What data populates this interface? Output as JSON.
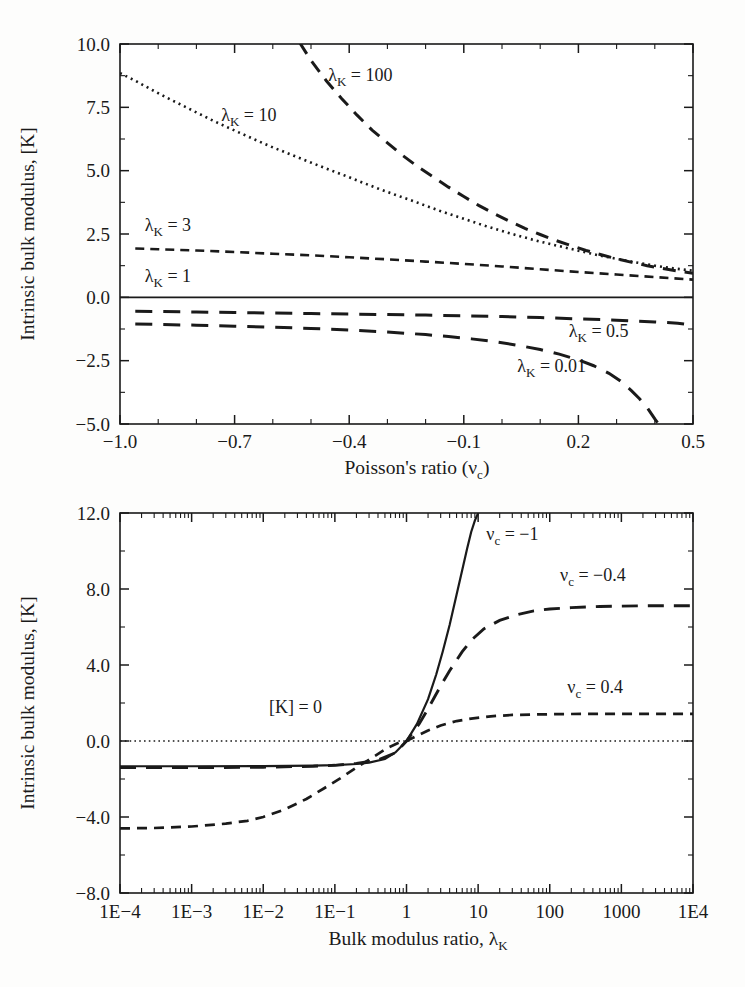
{
  "chart_data": [
    {
      "id": "top",
      "type": "line",
      "title": "",
      "xlabel": "Poisson's ratio (ν",
      "xlabel_sub": "c",
      "xlabel_tail": ")",
      "ylabel": "Intrinsic bulk modulus, [K]",
      "xlim": [
        -1.0,
        0.5
      ],
      "ylim": [
        -5.0,
        10.0
      ],
      "xticks": [
        "-1.0",
        "-0.7",
        "-0.4",
        "-0.1",
        "0.2",
        "0.5"
      ],
      "xtick_values": [
        -1.0,
        -0.7,
        -0.4,
        -0.1,
        0.2,
        0.5
      ],
      "yticks": [
        "10.0",
        "7.5",
        "5.0",
        "2.5",
        "0.0",
        "-2.5",
        "-5.0"
      ],
      "ytick_values": [
        10.0,
        7.5,
        5.0,
        2.5,
        0.0,
        -2.5,
        -5.0
      ],
      "grid": false,
      "legend": "inline-annotations",
      "series": [
        {
          "name": "λ_K = 100",
          "label_text": "λ",
          "label_sub": "K",
          "label_tail": " = 100",
          "style": "dashed",
          "dash": "13,9",
          "width": 3.0,
          "label_xy": [
            -0.455,
            8.55
          ],
          "x": [
            -0.58,
            -0.56,
            -0.54,
            -0.5,
            -0.46,
            -0.42,
            -0.38,
            -0.34,
            -0.3,
            -0.26,
            -0.22,
            -0.18,
            -0.14,
            -0.1,
            -0.06,
            -0.02,
            0.02,
            0.06,
            0.1,
            0.14,
            0.18,
            0.22,
            0.26,
            0.3,
            0.34,
            0.38,
            0.42,
            0.46,
            0.5
          ],
          "y": [
            11.6,
            10.9,
            10.3,
            9.35,
            8.55,
            7.85,
            7.2,
            6.6,
            6.1,
            5.6,
            5.15,
            4.75,
            4.35,
            3.98,
            3.62,
            3.3,
            3.0,
            2.72,
            2.48,
            2.25,
            2.05,
            1.85,
            1.68,
            1.52,
            1.38,
            1.25,
            1.14,
            1.04,
            0.95
          ]
        },
        {
          "name": "λ_K = 10",
          "label_text": "λ",
          "label_sub": "K",
          "label_tail": " = 10",
          "style": "dotted",
          "dash": "2,4",
          "width": 2.6,
          "label_xy": [
            -0.735,
            6.95
          ],
          "x": [
            -1.0,
            -0.96,
            -0.92,
            -0.88,
            -0.84,
            -0.8,
            -0.76,
            -0.72,
            -0.68,
            -0.64,
            -0.6,
            -0.56,
            -0.52,
            -0.48,
            -0.44,
            -0.4,
            -0.36,
            -0.32,
            -0.28,
            -0.24,
            -0.2,
            -0.16,
            -0.12,
            -0.08,
            -0.04,
            0.0,
            0.05,
            0.1,
            0.15,
            0.2,
            0.25,
            0.3,
            0.35,
            0.4,
            0.45,
            0.5
          ],
          "y": [
            8.85,
            8.55,
            8.22,
            7.9,
            7.6,
            7.3,
            7.0,
            6.72,
            6.45,
            6.18,
            5.92,
            5.68,
            5.44,
            5.2,
            4.97,
            4.74,
            4.5,
            4.27,
            4.05,
            3.84,
            3.62,
            3.4,
            3.2,
            3.0,
            2.8,
            2.62,
            2.4,
            2.2,
            2.02,
            1.84,
            1.67,
            1.52,
            1.38,
            1.25,
            1.14,
            1.05
          ]
        },
        {
          "name": "λ_K = 3",
          "label_text": "λ",
          "label_sub": "K",
          "label_tail": " = 3",
          "style": "dashed",
          "dash": "9,6",
          "width": 2.6,
          "label_xy": [
            -0.935,
            2.62
          ],
          "x": [
            -0.96,
            -0.9,
            -0.8,
            -0.7,
            -0.6,
            -0.5,
            -0.4,
            -0.3,
            -0.2,
            -0.1,
            0.0,
            0.1,
            0.2,
            0.3,
            0.4,
            0.5
          ],
          "y": [
            1.93,
            1.9,
            1.85,
            1.79,
            1.72,
            1.66,
            1.58,
            1.5,
            1.41,
            1.32,
            1.22,
            1.11,
            1.0,
            0.9,
            0.8,
            0.7
          ]
        },
        {
          "name": "λ_K = 1",
          "label_text": "λ",
          "label_sub": "K",
          "label_tail": " = 1",
          "style": "solid",
          "dash": "none",
          "width": 1.9,
          "label_xy": [
            -0.935,
            0.62
          ],
          "x": [
            -1.0,
            0.5
          ],
          "y": [
            0.0,
            0.0
          ]
        },
        {
          "name": "λ_K = 0.5",
          "label_text": "λ",
          "label_sub": "K",
          "label_tail": " = 0.5",
          "style": "long-dashed",
          "dash": "17,11",
          "width": 3.0,
          "label_xy": [
            0.175,
            -1.55
          ],
          "x": [
            -0.96,
            -0.9,
            -0.8,
            -0.7,
            -0.6,
            -0.5,
            -0.4,
            -0.3,
            -0.2,
            -0.1,
            0.0,
            0.1,
            0.2,
            0.3,
            0.4,
            0.46,
            0.5
          ],
          "y": [
            -0.55,
            -0.56,
            -0.58,
            -0.6,
            -0.62,
            -0.64,
            -0.66,
            -0.68,
            -0.7,
            -0.73,
            -0.76,
            -0.8,
            -0.85,
            -0.9,
            -0.97,
            -1.02,
            -1.1
          ]
        },
        {
          "name": "λ_K = 0.01",
          "label_text": "λ",
          "label_sub": "K",
          "label_tail": " = 0.01",
          "style": "long-dashed",
          "dash": "17,11",
          "width": 3.0,
          "label_xy": [
            0.04,
            -2.93
          ],
          "x": [
            -0.96,
            -0.9,
            -0.8,
            -0.7,
            -0.6,
            -0.5,
            -0.4,
            -0.3,
            -0.2,
            -0.14,
            -0.08,
            -0.02,
            0.04,
            0.1,
            0.15,
            0.2,
            0.24,
            0.28,
            0.31,
            0.34,
            0.36,
            0.38,
            0.4,
            0.41
          ],
          "y": [
            -1.05,
            -1.07,
            -1.1,
            -1.14,
            -1.18,
            -1.23,
            -1.29,
            -1.37,
            -1.47,
            -1.55,
            -1.64,
            -1.75,
            -1.89,
            -2.06,
            -2.24,
            -2.47,
            -2.7,
            -3.0,
            -3.3,
            -3.7,
            -4.0,
            -4.35,
            -4.8,
            -5.0
          ]
        }
      ]
    },
    {
      "id": "bottom",
      "type": "line",
      "title": "",
      "xlabel": "Bulk modulus ratio, λ",
      "xlabel_sub": "K",
      "ylabel": "Intrinsic bulk modulus, [K]",
      "xscale": "log",
      "xlim": [
        0.0001,
        10000
      ],
      "ylim": [
        -8.0,
        12.0
      ],
      "xticks": [
        "1E-4",
        "1E-3",
        "1E-2",
        "1E-1",
        "1",
        "10",
        "100",
        "1000",
        "1E4"
      ],
      "xtick_values": [
        0.0001,
        0.001,
        0.01,
        0.1,
        1,
        10,
        100,
        1000,
        10000
      ],
      "yticks": [
        "12.0",
        "8.0",
        "4.0",
        "0.0",
        "-4.0",
        "-8.0"
      ],
      "ytick_values": [
        12.0,
        8.0,
        4.0,
        0.0,
        -4.0,
        -8.0
      ],
      "grid": false,
      "legend": "inline-annotations",
      "series": [
        {
          "name": "[K] = 0",
          "label_text": "[K] = 0",
          "label_sub": "",
          "label_tail": "",
          "style": "dotted",
          "dash": "1.6,3.2",
          "width": 1.6,
          "label_xy": [
            0.012,
            1.45
          ],
          "x": [
            0.0001,
            10000
          ],
          "y": [
            0.0,
            0.0
          ]
        },
        {
          "name": "ν_c = -1",
          "label_text": "ν",
          "label_sub": "c",
          "label_tail": " = −1",
          "style": "solid",
          "dash": "none",
          "width": 2.2,
          "label_xy": [
            13.0,
            10.6
          ],
          "x": [
            0.0001,
            0.001,
            0.01,
            0.05,
            0.1,
            0.2,
            0.3,
            0.5,
            0.7,
            1.0,
            1.4,
            2.0,
            2.6,
            3.2,
            4.0,
            5.0,
            6.0,
            7.0,
            8.0,
            9.0,
            10.0,
            11.0,
            12.0
          ],
          "y": [
            -1.33,
            -1.33,
            -1.32,
            -1.3,
            -1.27,
            -1.21,
            -1.14,
            -0.95,
            -0.6,
            0.0,
            0.9,
            2.2,
            3.5,
            4.7,
            6.1,
            7.7,
            9.0,
            10.1,
            11.0,
            11.6,
            12.0,
            12.3,
            12.5
          ]
        },
        {
          "name": "ν_c = -0.4",
          "label_text": "ν",
          "label_sub": "c",
          "label_tail": " = −0.4",
          "style": "long-dashed",
          "dash": "16,10",
          "width": 2.9,
          "label_xy": [
            400.0,
            8.4
          ],
          "x": [
            0.0001,
            0.001,
            0.01,
            0.05,
            0.1,
            0.2,
            0.4,
            0.7,
            1.0,
            1.5,
            2.0,
            3.0,
            4.0,
            6.0,
            8.0,
            12.0,
            20.0,
            35.0,
            60.0,
            100.0,
            200.0,
            500.0,
            1000.0,
            3000.0,
            10000.0
          ],
          "y": [
            -1.4,
            -1.4,
            -1.38,
            -1.33,
            -1.28,
            -1.18,
            -1.0,
            -0.62,
            0.0,
            0.9,
            1.7,
            2.9,
            3.7,
            4.7,
            5.3,
            5.9,
            6.35,
            6.65,
            6.85,
            6.95,
            7.02,
            7.08,
            7.1,
            7.12,
            7.12
          ]
        },
        {
          "name": "ν_c = 0.4",
          "label_text": "ν",
          "label_sub": "c",
          "label_tail": " = 0.4",
          "style": "dashed",
          "dash": "10,7",
          "width": 2.7,
          "label_xy": [
            430.0,
            2.55
          ],
          "x": [
            0.0001,
            0.0003,
            0.001,
            0.003,
            0.006,
            0.01,
            0.02,
            0.04,
            0.07,
            0.12,
            0.2,
            0.35,
            0.55,
            0.8,
            1.0,
            1.4,
            2.0,
            3.0,
            5.0,
            8.0,
            15.0,
            30.0,
            70.0,
            200.0,
            700.0,
            3000.0,
            10000.0
          ],
          "y": [
            -4.6,
            -4.58,
            -4.5,
            -4.35,
            -4.2,
            -4.0,
            -3.6,
            -3.05,
            -2.5,
            -1.95,
            -1.4,
            -0.82,
            -0.35,
            -0.07,
            0.0,
            0.27,
            0.55,
            0.82,
            1.05,
            1.18,
            1.3,
            1.37,
            1.4,
            1.42,
            1.43,
            1.43,
            1.43
          ]
        }
      ]
    }
  ]
}
